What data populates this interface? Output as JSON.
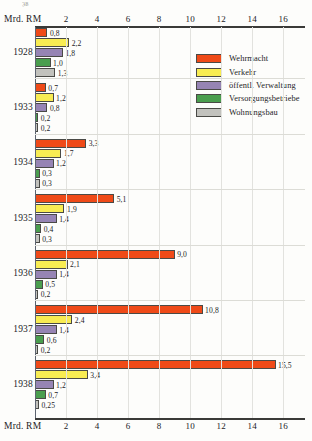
{
  "scrap_mark": "38",
  "axis": {
    "unit_label": "Mrd. RM",
    "ticks": [
      2,
      4,
      6,
      8,
      10,
      12,
      14,
      16
    ],
    "tick_labels": [
      "2",
      "4",
      "6",
      "8",
      "10",
      "12",
      "14",
      "16"
    ],
    "min": 0,
    "max": 16.8
  },
  "legend": {
    "items": [
      {
        "label": "Wehrmacht",
        "color": "#ef4a18"
      },
      {
        "label": "Verkehr",
        "color": "#f8ec52"
      },
      {
        "label": "öffentl. Verwaltung",
        "color": "#9684b4"
      },
      {
        "label": "Versorgungsbetriebe",
        "color": "#4a9e4e"
      },
      {
        "label": "Wohnungsbau",
        "color": "#c2c2bd"
      }
    ]
  },
  "chart_data": {
    "type": "bar",
    "orientation": "horizontal",
    "title": "",
    "xlabel": "Mrd. RM",
    "ylabel": "",
    "xlim": [
      0,
      16.8
    ],
    "grid": true,
    "legend_position": "top-right",
    "categories": [
      "1928",
      "1933",
      "1934",
      "1935",
      "1936",
      "1937",
      "1938"
    ],
    "series": [
      {
        "name": "Wehrmacht",
        "color": "#ef4a18",
        "values": [
          0.8,
          0.7,
          3.3,
          5.1,
          9.0,
          10.8,
          15.5
        ],
        "labels": [
          "0,8",
          "0,7",
          "3,3",
          "5,1",
          "9,0",
          "10,8",
          "15,5"
        ]
      },
      {
        "name": "Verkehr",
        "color": "#f8ec52",
        "values": [
          2.2,
          1.2,
          1.7,
          1.9,
          2.1,
          2.4,
          3.4
        ],
        "labels": [
          "2,2",
          "1,2",
          "1,7",
          "1,9",
          "2,1",
          "2,4",
          "3,4"
        ]
      },
      {
        "name": "öffentl. Verwaltung",
        "color": "#9684b4",
        "values": [
          1.8,
          0.8,
          1.2,
          1.4,
          1.4,
          1.4,
          1.2
        ],
        "labels": [
          "1,8",
          "0,8",
          "1,2",
          "1,4",
          "1,4",
          "1,4",
          "1,2"
        ]
      },
      {
        "name": "Versorgungsbetriebe",
        "color": "#4a9e4e",
        "values": [
          1.0,
          0.2,
          0.3,
          0.4,
          0.5,
          0.6,
          0.7
        ],
        "labels": [
          "1,0",
          "0,2",
          "0,3",
          "0,4",
          "0,5",
          "0,6",
          "0,7"
        ]
      },
      {
        "name": "Wohnungsbau",
        "color": "#c2c2bd",
        "values": [
          1.3,
          0.2,
          0.3,
          0.3,
          0.2,
          0.2,
          0.25
        ],
        "labels": [
          "1,3",
          "0,2",
          "0,3",
          "0,3",
          "0,2",
          "0,2",
          "0,25"
        ]
      }
    ]
  }
}
